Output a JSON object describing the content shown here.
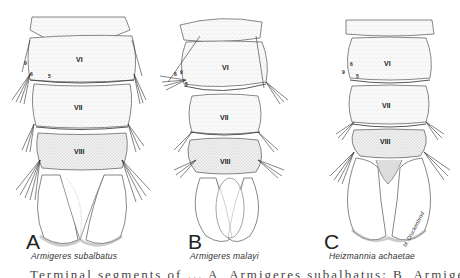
{
  "figure": {
    "panels": [
      {
        "letter": "A",
        "species": "Armigeres  subalbatus",
        "segments": [
          "VI",
          "VII",
          "VIII"
        ],
        "seta_numbers": [
          "9",
          "6",
          "5"
        ]
      },
      {
        "letter": "B",
        "species": "Armigeres  malayi",
        "segments": [
          "VI",
          "VII",
          "VIII"
        ],
        "seta_numbers": [
          "6",
          "9",
          "5"
        ]
      },
      {
        "letter": "C",
        "species": "Heizmannia  achaetae",
        "segments": [
          "VI",
          "VII",
          "VIII"
        ],
        "seta_numbers": [
          "6",
          "9",
          "5"
        ]
      }
    ],
    "signature": "M. Druckenbrod",
    "caption": "Terminal segments of ... A, Armigeres subalbatus; B, Armigeres malayi; C, ..."
  }
}
